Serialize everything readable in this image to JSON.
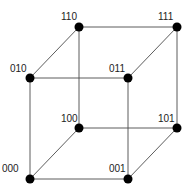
{
  "diagram": {
    "type": "cube-graph",
    "nodes": [
      {
        "id": "000",
        "label": "000",
        "x": 30,
        "y": 179,
        "lx": 2,
        "ly": 172
      },
      {
        "id": "001",
        "label": "001",
        "x": 128,
        "y": 179,
        "lx": 109,
        "ly": 172
      },
      {
        "id": "010",
        "label": "010",
        "x": 30,
        "y": 78,
        "lx": 10,
        "ly": 72
      },
      {
        "id": "011",
        "label": "011",
        "x": 128,
        "y": 78,
        "lx": 109,
        "ly": 72
      },
      {
        "id": "100",
        "label": "100",
        "x": 79,
        "y": 128,
        "lx": 61,
        "ly": 122
      },
      {
        "id": "101",
        "label": "101",
        "x": 177,
        "y": 128,
        "lx": 158,
        "ly": 122
      },
      {
        "id": "110",
        "label": "110",
        "x": 79,
        "y": 27,
        "lx": 61,
        "ly": 20
      },
      {
        "id": "111",
        "label": "111",
        "x": 177,
        "y": 27,
        "lx": 158,
        "ly": 20
      }
    ],
    "edges": [
      [
        "000",
        "001"
      ],
      [
        "000",
        "010"
      ],
      [
        "000",
        "100"
      ],
      [
        "001",
        "011"
      ],
      [
        "001",
        "101"
      ],
      [
        "010",
        "011"
      ],
      [
        "010",
        "110"
      ],
      [
        "011",
        "111"
      ],
      [
        "100",
        "101"
      ],
      [
        "100",
        "110"
      ],
      [
        "101",
        "111"
      ],
      [
        "110",
        "111"
      ]
    ],
    "colors": {
      "node": "#000000",
      "edge": "#4a4a4a",
      "label": "#222222"
    }
  }
}
